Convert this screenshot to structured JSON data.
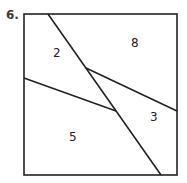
{
  "problem": {
    "number": "6."
  },
  "diagram": {
    "square": {
      "x1": 24,
      "y1": 14,
      "x2": 177,
      "y2": 175
    },
    "lines": [
      {
        "name": "long-diagonal",
        "x1": 48,
        "y1": 14,
        "x2": 161,
        "y2": 175
      },
      {
        "name": "left-segment",
        "x1": 24,
        "y1": 78,
        "x2": 116,
        "y2": 111
      },
      {
        "name": "right-segment",
        "x1": 86,
        "y1": 68,
        "x2": 177,
        "y2": 111
      }
    ],
    "regions": [
      {
        "label": "2",
        "x": 53,
        "y": 57
      },
      {
        "label": "8",
        "x": 131,
        "y": 47
      },
      {
        "label": "3",
        "x": 150,
        "y": 121
      },
      {
        "label": "5",
        "x": 69,
        "y": 141
      }
    ],
    "stroke_color": "#222222"
  }
}
